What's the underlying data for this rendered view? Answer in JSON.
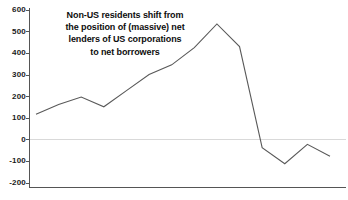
{
  "chart_data": {
    "type": "line",
    "title": "",
    "subtitle": "",
    "xlabel": "",
    "ylabel": "",
    "ylim": [
      -200,
      600
    ],
    "ytick_values": [
      600,
      500,
      400,
      300,
      200,
      100,
      0,
      -100,
      -200
    ],
    "ytick_labels": [
      "600",
      "500",
      "400",
      "300",
      "200",
      "100",
      "0",
      "-100",
      "-200"
    ],
    "xtick_labels": [],
    "grid": false,
    "zero_line": 0,
    "legend": null,
    "legend_position": "none",
    "series": [
      {
        "name": "Non-US residents net position in US corporations",
        "color": "#595959",
        "x": [
          0,
          1,
          2,
          3,
          4,
          5,
          6,
          7,
          8,
          9,
          10,
          11,
          12,
          13
        ],
        "values": [
          115,
          160,
          195,
          150,
          225,
          300,
          345,
          425,
          535,
          430,
          -40,
          -115,
          -25,
          -80
        ]
      }
    ],
    "annotations": [
      {
        "name": "main-annotation",
        "lines": [
          "Non-US residents shift from",
          "the position of (massive) net",
          "lenders of US corporations",
          "to net borrowers"
        ]
      }
    ]
  }
}
